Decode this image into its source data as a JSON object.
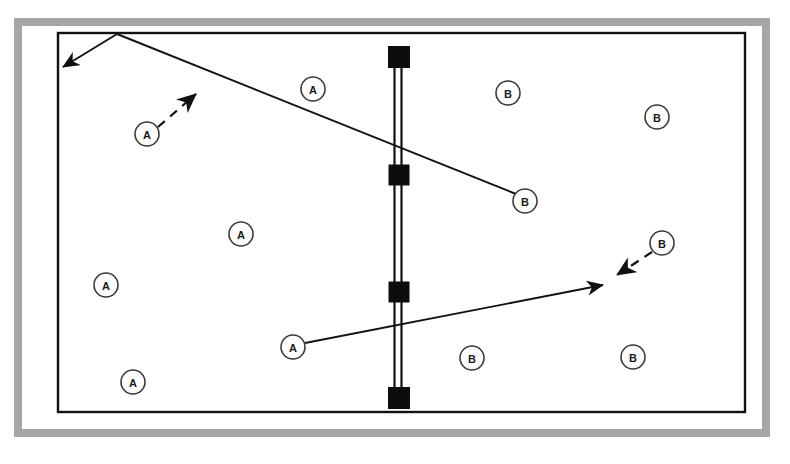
{
  "diagram": {
    "colors": {
      "outer_frame": "#a6a6a6",
      "court_line": "#111111",
      "net": "#111111",
      "post": "#0d0d0d",
      "marker_stroke": "#3a3a3a",
      "marker_fill": "#ffffff",
      "background": "#ffffff"
    },
    "outer_frame": {
      "x": 14,
      "y": 18,
      "width": 756,
      "height": 419,
      "thickness": 8
    },
    "court": {
      "x": 58,
      "y": 33,
      "width": 687,
      "height": 379,
      "stroke_width": 2.4
    },
    "net": {
      "name": "center-net",
      "x": 398,
      "y_top": 52,
      "y_bottom": 400,
      "line_gap": 7,
      "stroke_width": 2.2
    },
    "posts": [
      {
        "name": "net-post-top",
        "cx": 399,
        "cy": 57,
        "size": 22
      },
      {
        "name": "net-post-upper-middle",
        "cx": 399,
        "cy": 175,
        "size": 21
      },
      {
        "name": "net-post-lower-middle",
        "cx": 399,
        "cy": 292,
        "size": 21
      },
      {
        "name": "net-post-bottom",
        "cx": 399,
        "cy": 398,
        "size": 22
      }
    ],
    "markers": [
      {
        "id": "a1",
        "label": "A",
        "team": "A",
        "cx": 313,
        "cy": 89,
        "r": 12
      },
      {
        "id": "a2",
        "label": "A",
        "team": "A",
        "cx": 147,
        "cy": 134,
        "r": 12
      },
      {
        "id": "a3",
        "label": "A",
        "team": "A",
        "cx": 241,
        "cy": 234,
        "r": 12
      },
      {
        "id": "a4",
        "label": "A",
        "team": "A",
        "cx": 106,
        "cy": 285,
        "r": 12
      },
      {
        "id": "a5",
        "label": "A",
        "team": "A",
        "cx": 293,
        "cy": 347,
        "r": 12
      },
      {
        "id": "a6",
        "label": "A",
        "team": "A",
        "cx": 133,
        "cy": 382,
        "r": 12
      },
      {
        "id": "b1",
        "label": "B",
        "team": "B",
        "cx": 508,
        "cy": 93,
        "r": 12
      },
      {
        "id": "b2",
        "label": "B",
        "team": "B",
        "cx": 657,
        "cy": 117,
        "r": 12
      },
      {
        "id": "b3",
        "label": "B",
        "team": "B",
        "cx": 525,
        "cy": 201,
        "r": 12
      },
      {
        "id": "b4",
        "label": "B",
        "team": "B",
        "cx": 662,
        "cy": 243,
        "r": 12
      },
      {
        "id": "b5",
        "label": "B",
        "team": "B",
        "cx": 472,
        "cy": 358,
        "r": 12
      },
      {
        "id": "b6",
        "label": "B",
        "team": "B",
        "cx": 633,
        "cy": 357,
        "r": 12
      }
    ],
    "paths": [
      {
        "id": "ball-path-upper-return",
        "name": "ball-path-to-back-left-corner",
        "style": "solid",
        "arrow": "end",
        "points": [
          [
            117,
            34
          ],
          [
            63,
            67
          ]
        ]
      },
      {
        "id": "ball-path-upper-serve",
        "name": "ball-path-from-apex-to-player-b3",
        "style": "solid",
        "arrow": "none",
        "points": [
          [
            117,
            34
          ],
          [
            516,
            194
          ]
        ]
      },
      {
        "id": "player-move-a2",
        "name": "player-movement-a2",
        "style": "dashed",
        "arrow": "end",
        "points": [
          [
            158,
            127
          ],
          [
            196,
            94
          ]
        ]
      },
      {
        "id": "ball-path-lower",
        "name": "ball-path-from-player-a5",
        "style": "solid",
        "arrow": "end",
        "points": [
          [
            305,
            343
          ],
          [
            603,
            285
          ]
        ]
      },
      {
        "id": "player-move-b4",
        "name": "player-movement-b4",
        "style": "dashed",
        "arrow": "end",
        "points": [
          [
            652,
            252
          ],
          [
            617,
            275
          ]
        ]
      }
    ],
    "legend": {
      "team_a_label": "A",
      "team_b_label": "B"
    }
  }
}
